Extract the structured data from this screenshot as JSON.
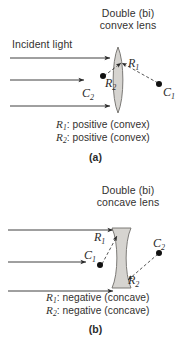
{
  "figure": {
    "kind": "optics-lens-sign-convention-diagram",
    "background_color": "#ffffff",
    "ink_color": "#2b2b2b",
    "lens_fill_color": "#d6d4d0",
    "lens_stroke_color": "#6f6d6a"
  },
  "panel_a": {
    "letter": "(a)",
    "title_line1": "Double (bi)",
    "title_line2": "convex lens",
    "incident_label": "Incident light",
    "lens_type": "double convex",
    "ray_count": 3,
    "markers": [
      {
        "name": "C2",
        "symbol": "C",
        "subscript": "2",
        "side": "left"
      },
      {
        "name": "C1",
        "symbol": "C",
        "subscript": "1",
        "side": "right"
      }
    ],
    "radii": [
      {
        "name": "R1",
        "symbol": "R",
        "subscript": "1",
        "side": "right"
      },
      {
        "name": "R2",
        "symbol": "R",
        "subscript": "2",
        "side": "left"
      }
    ],
    "caption": {
      "line1_symbol": "R",
      "line1_sub": "1",
      "line1_text": ": positive (convex)",
      "line2_symbol": "R",
      "line2_sub": "2",
      "line2_text": ": positive (convex)"
    }
  },
  "panel_b": {
    "letter": "(b)",
    "title_line1": "Double (bi)",
    "title_line2": "concave lens",
    "lens_type": "double concave",
    "ray_count": 3,
    "markers": [
      {
        "name": "C1",
        "symbol": "C",
        "subscript": "1",
        "side": "left"
      },
      {
        "name": "C2",
        "symbol": "C",
        "subscript": "2",
        "side": "right"
      }
    ],
    "radii": [
      {
        "name": "R1",
        "symbol": "R",
        "subscript": "1",
        "side": "left"
      },
      {
        "name": "R2",
        "symbol": "R",
        "subscript": "2",
        "side": "right"
      }
    ],
    "caption": {
      "line1_symbol": "R",
      "line1_sub": "1",
      "line1_text": ": negative (concave)",
      "line2_symbol": "R",
      "line2_sub": "2",
      "line2_text": ": negative (concave)"
    }
  }
}
